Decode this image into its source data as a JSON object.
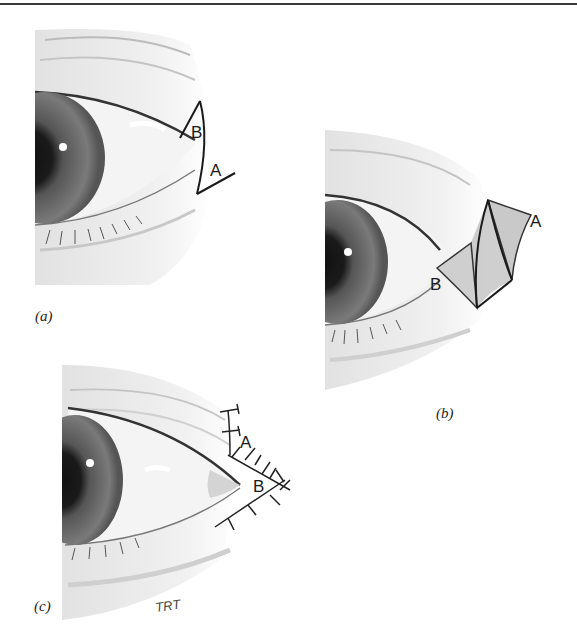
{
  "figure": {
    "panels": [
      {
        "id": "a",
        "caption": "(a)",
        "labels": {
          "flap_b": "B",
          "flap_a": "A"
        },
        "description": "Lateral canthus with outlined triangular flaps A and B"
      },
      {
        "id": "b",
        "caption": "(b)",
        "labels": {
          "flap_b": "B",
          "flap_a": "A"
        },
        "description": "Flaps incised and transposed forming diamond defect"
      },
      {
        "id": "c",
        "caption": "(c)",
        "labels": {
          "flap_a": "A",
          "flap_b": "B"
        },
        "description": "Flaps sutured in place",
        "signature": "TRT"
      }
    ]
  }
}
